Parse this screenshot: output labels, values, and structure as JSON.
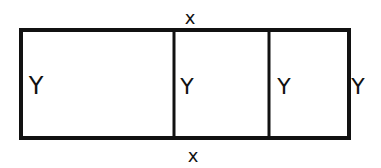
{
  "diagram": {
    "stroke_color": "#111111",
    "background": "#ffffff",
    "labels": {
      "top": "x",
      "bottom": "x",
      "left_side": "Y",
      "divider_1": "Y",
      "divider_2": "Y",
      "right_side": "Y"
    }
  }
}
